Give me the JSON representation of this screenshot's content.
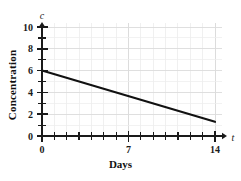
{
  "chart_data": {
    "type": "line",
    "title": "",
    "xlabel": "Days",
    "ylabel": "Concentration",
    "x_axis_variable": "t",
    "y_axis_variable": "c",
    "xlim": [
      0,
      14.6
    ],
    "ylim": [
      0,
      10.6
    ],
    "grid": true,
    "legend": null,
    "x_tick_labels": [
      "0",
      "7",
      "14"
    ],
    "x_tick_values": [
      0,
      7,
      14
    ],
    "x_minor_ticks": [
      1,
      2,
      3,
      4,
      5,
      6,
      8,
      9,
      10,
      11,
      12,
      13
    ],
    "y_tick_labels": [
      "0",
      "2",
      "4",
      "6",
      "8",
      "10"
    ],
    "y_tick_values": [
      0,
      2,
      4,
      6,
      8,
      10
    ],
    "y_minor_ticks": [
      1,
      3,
      5,
      7,
      9
    ],
    "series": [
      {
        "name": "Concentration",
        "x": [
          0,
          14
        ],
        "values": [
          6,
          1.3
        ],
        "color": "#111111"
      }
    ],
    "line_color": "#111111",
    "grid_color": "#e2e2e2",
    "axis_color": "#1a1a1a",
    "background": "#ffffff"
  },
  "labels": {
    "y_axis_title": "Concentration",
    "x_axis_title": "Days",
    "y_axis_var": "c",
    "x_axis_var": "t"
  }
}
